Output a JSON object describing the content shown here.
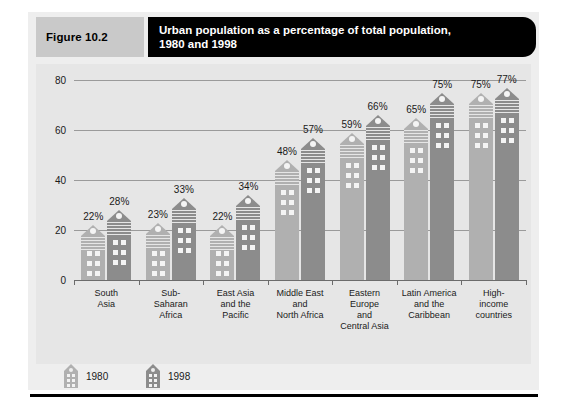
{
  "figure": {
    "number_label": "Figure 10.2",
    "title": "Urban population as a percentage of total population,\n1980 and 1998"
  },
  "legend": {
    "position": "bottom-left",
    "entries": [
      {
        "label": "1980",
        "color": "#b0b0b0",
        "icon": "building-icon-light"
      },
      {
        "label": "1998",
        "color": "#8c8c8c",
        "icon": "building-icon-dark"
      }
    ]
  },
  "axes": {
    "y_ticks": [
      "0",
      "20",
      "40",
      "60",
      "80"
    ],
    "x_categories": [
      "South\nAsia",
      "Sub-\nSaharan\nAfrica",
      "East Asia\nand the\nPacific",
      "Middle East\nand\nNorth Africa",
      "Eastern\nEurope\nand\nCentral Asia",
      "Latin America\nand the\nCaribbean",
      "High-\nincome\ncountries"
    ]
  },
  "value_labels": {
    "1980": [
      "22%",
      "23%",
      "22%",
      "48%",
      "59%",
      "65%",
      "75%"
    ],
    "1998": [
      "28%",
      "33%",
      "34%",
      "57%",
      "66%",
      "75%",
      "77%"
    ]
  },
  "colors": {
    "panel_background": "#e6e6e6",
    "card_background": "#eeeeee",
    "title_bar": "#000000",
    "figure_number_bar": "#c9c9c9",
    "series_1980": "#b0b0b0",
    "series_1998": "#8c8c8c",
    "gridline": "#9a9a9a",
    "axis": "#6b6b6b",
    "bottom_rule": "#000000"
  },
  "chart_data": {
    "type": "bar",
    "title": "Urban population as a percentage of total population, 1980 and 1998",
    "xlabel": "",
    "ylabel": "",
    "ylim": [
      0,
      80
    ],
    "yticks": [
      0,
      20,
      40,
      60,
      80
    ],
    "grid": true,
    "legend_position": "bottom-left",
    "categories": [
      "South Asia",
      "Sub-Saharan Africa",
      "East Asia and the Pacific",
      "Middle East and North Africa",
      "Eastern Europe and Central Asia",
      "Latin America and the Caribbean",
      "High-income countries"
    ],
    "series": [
      {
        "name": "1980",
        "color": "#b0b0b0",
        "values": [
          22,
          23,
          22,
          48,
          59,
          65,
          75
        ]
      },
      {
        "name": "1998",
        "color": "#8c8c8c",
        "values": [
          28,
          33,
          34,
          57,
          66,
          75,
          77
        ]
      }
    ]
  }
}
